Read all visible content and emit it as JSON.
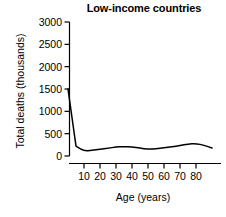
{
  "chart_data": {
    "type": "line",
    "title": "Low-income countries",
    "xlabel": "Age (years)",
    "ylabel": "Total deaths (thousands)",
    "xlim": [
      0,
      90
    ],
    "ylim": [
      0,
      3000
    ],
    "xticks": [
      10,
      20,
      30,
      40,
      50,
      60,
      70,
      80
    ],
    "yticks": [
      0,
      500,
      1000,
      1500,
      2000,
      2500,
      3000
    ],
    "grid": false,
    "legend": "none",
    "line_color": "#000000",
    "series": [
      {
        "name": "Total deaths",
        "x": [
          0,
          5,
          10,
          15,
          20,
          25,
          30,
          35,
          40,
          45,
          50,
          55,
          60,
          65,
          70,
          75,
          80,
          85,
          90
        ],
        "values": [
          1500,
          220,
          110,
          125,
          150,
          175,
          200,
          210,
          205,
          175,
          155,
          160,
          185,
          205,
          230,
          270,
          280,
          240,
          180
        ]
      }
    ]
  },
  "axis": {
    "ytick_labels": [
      "3000",
      "2500",
      "2000",
      "1500",
      "1000",
      "500",
      "0"
    ],
    "xtick_labels": [
      "10",
      "20",
      "30",
      "40",
      "50",
      "60",
      "70",
      "80"
    ]
  }
}
